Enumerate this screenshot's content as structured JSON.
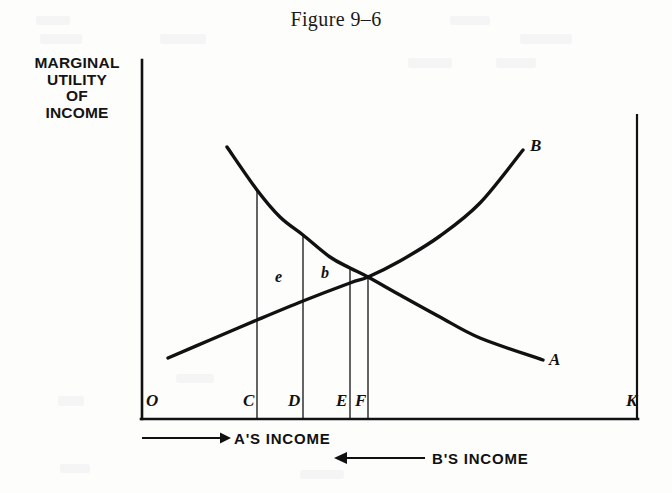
{
  "figure": {
    "title": "Figure 9–6",
    "y_axis_caption_lines": [
      "MARGINAL",
      "UTILITY",
      "OF",
      "INCOME"
    ],
    "axis_labels": {
      "origin": "O",
      "c": "C",
      "d": "D",
      "e": "E",
      "f": "F",
      "k": "K"
    },
    "area_labels": {
      "e": "e",
      "b": "b"
    },
    "curve_labels": {
      "a": "A",
      "b": "B"
    },
    "annotations": {
      "a_income": "A'S  INCOME",
      "b_income": "B'S  INCOME"
    },
    "ink_color": "#111111"
  },
  "chart_data": {
    "type": "line",
    "title": "Figure 9–6",
    "xlabel": "",
    "ylabel": "MARGINAL UTILITY OF INCOME",
    "grid": false,
    "legend": "inline-curve-labels",
    "axis": {
      "x_origin_label": "O",
      "x_end_label": "K",
      "x_tick_labels": [
        "O",
        "C",
        "D",
        "E",
        "F",
        "K"
      ],
      "x_tick_positions_px": [
        142,
        257,
        303,
        350,
        368,
        637
      ],
      "y_range_note": "unscaled ordinal axis",
      "plot_box_px": {
        "left": 142,
        "right": 637,
        "top": 60,
        "bottom": 419
      }
    },
    "series": [
      {
        "name": "A",
        "description": "A's marginal utility of income, falling left-to-right (measured from O rightward)",
        "label": "A",
        "points_px": [
          [
            227,
            147
          ],
          [
            257,
            190
          ],
          [
            280,
            217
          ],
          [
            303,
            235
          ],
          [
            330,
            257
          ],
          [
            350,
            268
          ],
          [
            368,
            277
          ],
          [
            400,
            295
          ],
          [
            440,
            317
          ],
          [
            480,
            338
          ],
          [
            543,
            360
          ]
        ]
      },
      {
        "name": "B",
        "description": "B's marginal utility of income, rising left-to-right (measured from K leftward)",
        "label": "B",
        "points_px": [
          [
            168,
            358
          ],
          [
            210,
            340
          ],
          [
            257,
            320
          ],
          [
            303,
            301
          ],
          [
            350,
            283
          ],
          [
            368,
            277
          ],
          [
            400,
            261
          ],
          [
            440,
            236
          ],
          [
            480,
            203
          ],
          [
            523,
            150
          ]
        ]
      }
    ],
    "vertical_drop_lines": [
      {
        "label": "C",
        "x_px": 257,
        "top_px": 190,
        "bottom_px": 419
      },
      {
        "label": "D",
        "x_px": 303,
        "top_px": 235,
        "bottom_px": 419
      },
      {
        "label": "E",
        "x_px": 350,
        "top_px": 268,
        "bottom_px": 419
      },
      {
        "label": "F",
        "x_px": 368,
        "top_px": 277,
        "bottom_px": 419
      }
    ],
    "annotations": [
      {
        "text": "e",
        "x_px": 279,
        "y_px": 279,
        "kind": "area-label"
      },
      {
        "text": "b",
        "x_px": 325,
        "y_px": 277,
        "kind": "area-label"
      },
      {
        "text": "A'S  INCOME",
        "x_px": 232,
        "y_px": 443,
        "kind": "arrow-right",
        "arrow_from_px": 142,
        "arrow_to_px": 228
      },
      {
        "text": "B'S  INCOME",
        "x_px": 430,
        "y_px": 463,
        "kind": "arrow-left",
        "arrow_from_px": 425,
        "arrow_to_px": 334
      }
    ],
    "intersection_px": [
      368,
      277
    ]
  }
}
